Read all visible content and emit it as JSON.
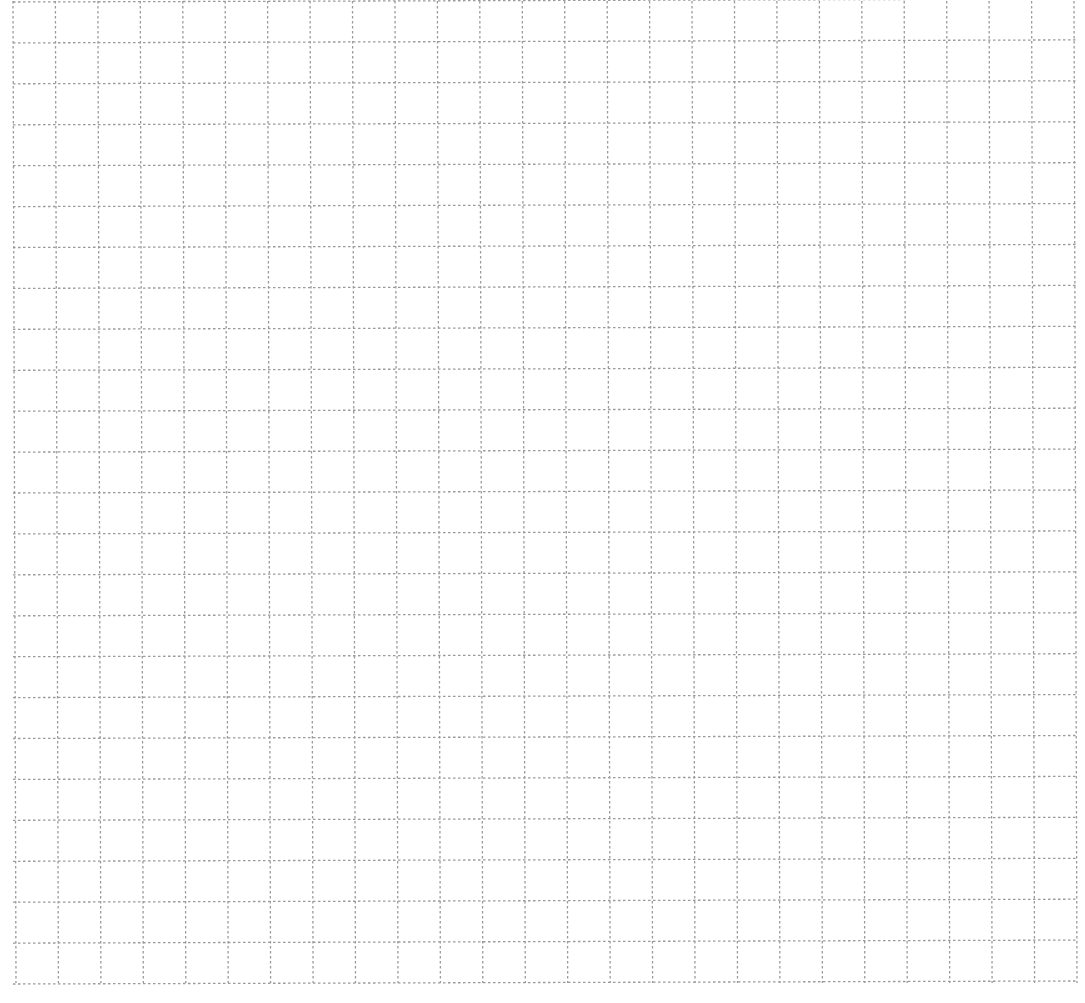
{
  "page": {
    "background": "#ffffff",
    "grid": {
      "line_color": "#9a9a9a",
      "line_style": "dotted",
      "columns": 25,
      "rows": 24,
      "left": 13,
      "top": 1,
      "right": 1074,
      "bottom": 983
    }
  }
}
